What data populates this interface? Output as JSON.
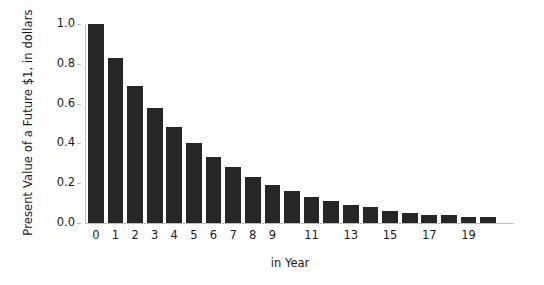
{
  "chart_data": {
    "type": "bar",
    "title": "",
    "xlabel": "in Year",
    "ylabel": "Present Value of a Future $1, in dollars",
    "categories": [
      "0",
      "1",
      "2",
      "3",
      "4",
      "5",
      "6",
      "7",
      "8",
      "9",
      "10",
      "11",
      "12",
      "13",
      "14",
      "15",
      "16",
      "17",
      "18",
      "19",
      "20"
    ],
    "values": [
      1.0,
      0.83,
      0.69,
      0.58,
      0.48,
      0.4,
      0.33,
      0.28,
      0.23,
      0.19,
      0.16,
      0.13,
      0.11,
      0.09,
      0.08,
      0.06,
      0.05,
      0.04,
      0.04,
      0.03,
      0.03
    ],
    "xtick_labels": [
      "0",
      "1",
      "2",
      "3",
      "4",
      "5",
      "6",
      "7",
      "8",
      "9",
      "11",
      "13",
      "15",
      "17",
      "19"
    ],
    "xtick_positions": [
      0,
      1,
      2,
      3,
      4,
      5,
      6,
      7,
      8,
      9,
      11,
      13,
      15,
      17,
      19
    ],
    "ytick_labels": [
      "0.0",
      "0.2",
      "0.4",
      "0.6",
      "0.8",
      "1.0"
    ],
    "ytick_values": [
      0.0,
      0.2,
      0.4,
      0.6,
      0.8,
      1.0
    ],
    "ylim": [
      0.0,
      1.0
    ],
    "xlim": [
      -0.5,
      20.5
    ],
    "grid": false,
    "legend": false,
    "bar_color": "#262626",
    "axis_color": "#bdbdbd",
    "text_color": "#1a1a1a",
    "background": "#ffffff"
  }
}
